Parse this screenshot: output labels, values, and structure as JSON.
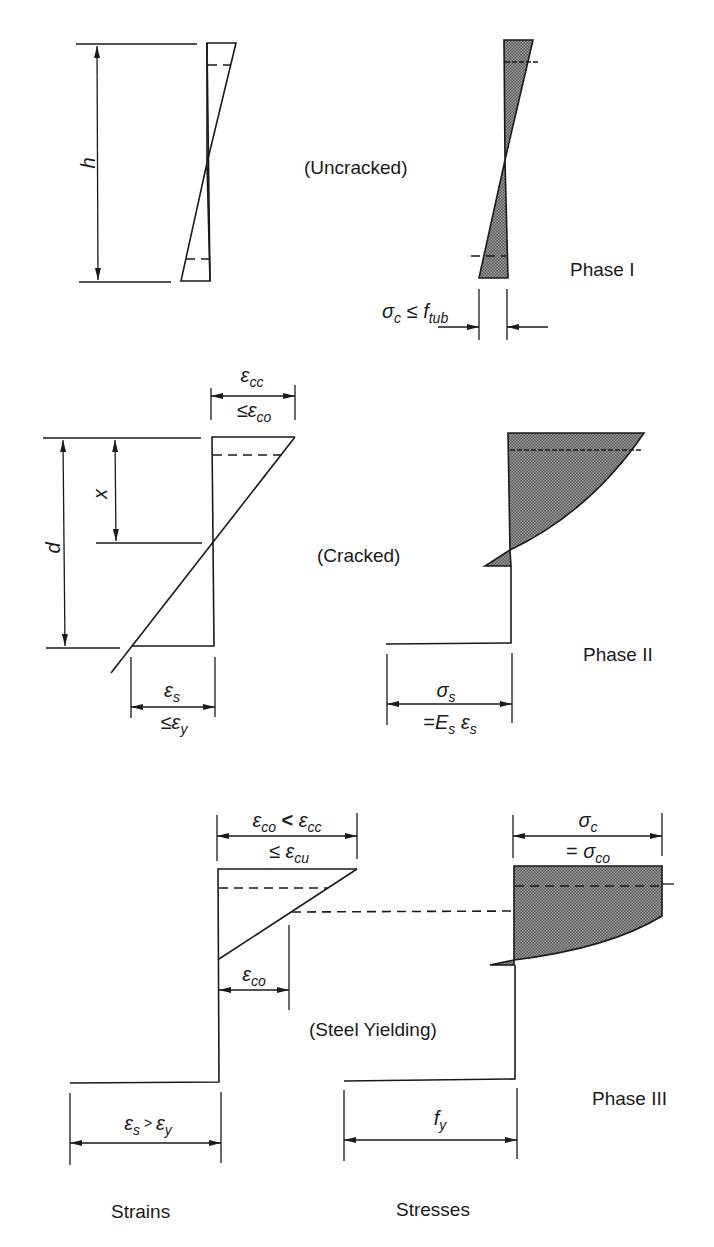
{
  "colors": {
    "ink": "#1a1a1a",
    "hatch_fill": "#6e6e6e",
    "background": "#ffffff"
  },
  "phases": [
    {
      "name": "Phase I",
      "state": "(Uncracked)",
      "dimensions": {
        "height_label": "h"
      },
      "stress_label": {
        "sigma": "σ",
        "sigma_sub": "c",
        "rel": " ≤ ",
        "f": "f",
        "f_sub": "tub"
      }
    },
    {
      "name": "Phase II",
      "state": "(Cracked)",
      "dimensions": {
        "depth_label": "d",
        "neutral_axis_label": "x"
      },
      "strain_top": {
        "line1_eps": "ε",
        "line1_sub": "cc",
        "line2_rel": "≤",
        "line2_eps": "ε",
        "line2_sub": "co"
      },
      "strain_bottom": {
        "line1_eps": "ε",
        "line1_sub": "s",
        "line2_rel": "≤",
        "line2_eps": "ε",
        "line2_sub": "y"
      },
      "stress_bottom": {
        "line1_sigma": "σ",
        "line1_sub": "s",
        "line2_eq": "=",
        "line2_E": "E",
        "line2_E_sub": "s",
        "line2_eps": " ε",
        "line2_eps_sub": "s"
      }
    },
    {
      "name": "Phase III",
      "state": "(Steel Yielding)",
      "strain_top": {
        "a": "ε",
        "a_sub": "co",
        "rel": " < ",
        "b": "ε",
        "b_sub": "cc",
        "line2_rel": "≤ ",
        "line2_eps": "ε",
        "line2_sub": "cu"
      },
      "strain_mid": {
        "eps": "ε",
        "sub": "co"
      },
      "strain_bottom": {
        "a": "ε",
        "a_sub": "s",
        "rel": " > ",
        "b": "ε",
        "b_sub": "y"
      },
      "stress_top": {
        "sigma": "σ",
        "sub": "c",
        "line2_eq": "= ",
        "line2_sigma": "σ",
        "line2_sub": "co"
      },
      "stress_bottom": {
        "f": "f",
        "sub": "y"
      }
    }
  ],
  "footer": {
    "strains_label": "Strains",
    "stresses_label": "Stresses"
  }
}
